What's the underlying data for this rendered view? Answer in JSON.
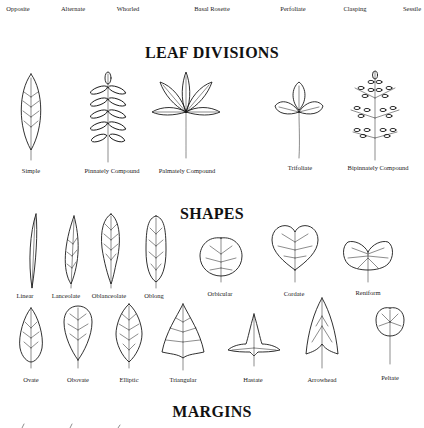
{
  "arrangements": {
    "labels": [
      "Opposite",
      "Alternate",
      "Whorled",
      "Basal Rosette",
      "Perfoliate",
      "Clasping",
      "Sessile"
    ]
  },
  "leaf_divisions": {
    "heading": "LEAF DIVISIONS",
    "items": [
      {
        "label": "Simple",
        "icon": "simple-leaf"
      },
      {
        "label": "Pinnately Compound",
        "icon": "pinnately-compound-leaf"
      },
      {
        "label": "Palmately Compound",
        "icon": "palmately-compound-leaf"
      },
      {
        "label": "Trifoliate",
        "icon": "trifoliate-leaf"
      },
      {
        "label": "Bipinnately Compound",
        "icon": "bipinnately-compound-leaf"
      }
    ]
  },
  "shapes": {
    "heading": "SHAPES",
    "row1": [
      {
        "label": "Linear",
        "icon": "linear-leaf"
      },
      {
        "label": "Lanceolate",
        "icon": "lanceolate-leaf"
      },
      {
        "label": "Oblanceolate",
        "icon": "oblanceolate-leaf"
      },
      {
        "label": "Oblong",
        "icon": "oblong-leaf"
      },
      {
        "label": "Orbicular",
        "icon": "orbicular-leaf"
      },
      {
        "label": "Cordate",
        "icon": "cordate-leaf"
      },
      {
        "label": "Reniform",
        "icon": "reniform-leaf"
      }
    ],
    "row2": [
      {
        "label": "Ovate",
        "icon": "ovate-leaf"
      },
      {
        "label": "Obovate",
        "icon": "obovate-leaf"
      },
      {
        "label": "Elliptic",
        "icon": "elliptic-leaf"
      },
      {
        "label": "Triangular",
        "icon": "triangular-leaf"
      },
      {
        "label": "Hastate",
        "icon": "hastate-leaf"
      },
      {
        "label": "Arrowhead",
        "icon": "arrowhead-leaf"
      },
      {
        "label": "Peltate",
        "icon": "peltate-leaf"
      }
    ]
  },
  "margins": {
    "heading": "MARGINS"
  }
}
